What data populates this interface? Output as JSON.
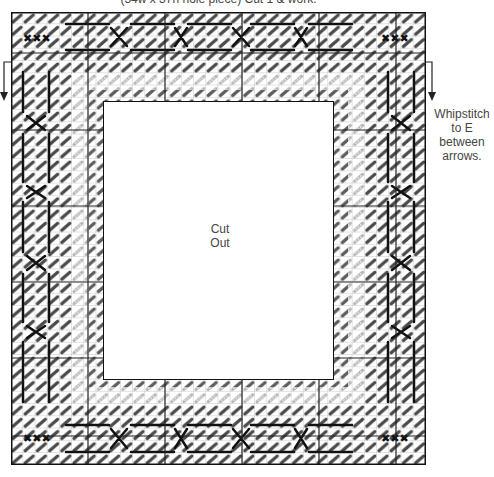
{
  "header": {
    "caption": "(34w x 37h hole piece) Cut 1 & work."
  },
  "chart": {
    "holes_wide": 34,
    "holes_high": 37,
    "major_grid_every": 10,
    "cutout_label_line1": "Cut",
    "cutout_label_line2": "Out"
  },
  "annotations": {
    "whipstitch_line1": "Whipstitch",
    "whipstitch_line2": "to E",
    "whipstitch_line3": "between",
    "whipstitch_line4": "arrows."
  },
  "colors": {
    "grid_line": "#9a9a9a",
    "major_grid_line": "#222222",
    "stitch_dark": "#111111",
    "stitch_mid": "#5a5a5a",
    "stitch_light": "#a8a8a8",
    "background": "#ffffff"
  },
  "icons": {
    "left_arrow": "down-arrow",
    "right_arrow": "down-arrow"
  }
}
